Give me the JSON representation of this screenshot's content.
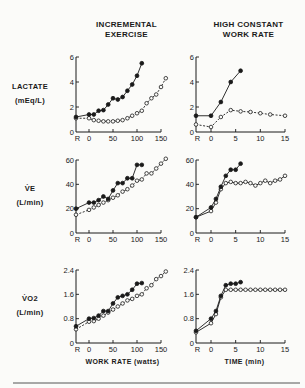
{
  "chart_data": [
    {
      "type": "line",
      "id": "lactate-incremental",
      "column_title": [
        "INCREMENTAL",
        "EXERCISE"
      ],
      "ylabel": [
        "LACTATE",
        "(mEq/L)"
      ],
      "xlabel": "",
      "xlim": [
        "R",
        150
      ],
      "ylim": [
        0,
        6
      ],
      "yticks": [
        0,
        2,
        4,
        6
      ],
      "ytick_labels": [
        "0",
        "2",
        "4",
        "6"
      ],
      "xticks": [
        "R",
        0,
        50,
        100,
        150
      ],
      "xtick_labels": [
        "R",
        "0",
        "50",
        "100",
        "150"
      ],
      "series": [
        {
          "name": "filled",
          "marker": "filled",
          "style": "solid",
          "x": [
            "R",
            0,
            10,
            20,
            30,
            40,
            50,
            60,
            70,
            80,
            90,
            100,
            110
          ],
          "y": [
            1.2,
            1.4,
            1.4,
            1.7,
            1.75,
            2.2,
            2.7,
            2.6,
            2.8,
            3.3,
            3.8,
            4.5,
            5.5
          ]
        },
        {
          "name": "open",
          "marker": "open",
          "style": "dashed",
          "x": [
            "R",
            0,
            10,
            20,
            30,
            40,
            50,
            60,
            70,
            80,
            90,
            100,
            110,
            120,
            130,
            140,
            150,
            160
          ],
          "y": [
            1.1,
            1.1,
            0.95,
            0.9,
            0.85,
            0.85,
            0.85,
            0.9,
            0.95,
            1.1,
            1.3,
            1.5,
            1.7,
            2.3,
            2.7,
            3.0,
            3.6,
            4.3
          ]
        }
      ]
    },
    {
      "type": "line",
      "id": "lactate-constant",
      "column_title": [
        "HIGH CONSTANT",
        "WORK RATE"
      ],
      "ylabel": [],
      "xlabel": "",
      "xlim": [
        "R",
        15
      ],
      "ylim": [
        0,
        6
      ],
      "yticks": [
        0,
        2,
        4,
        6
      ],
      "ytick_labels": [
        "0",
        "2",
        "4",
        "6"
      ],
      "xticks": [
        "R",
        0,
        5,
        10,
        15
      ],
      "xtick_labels": [
        "R",
        "0",
        "5",
        "10",
        "15"
      ],
      "series": [
        {
          "name": "filled",
          "marker": "filled",
          "style": "solid",
          "x": [
            "R",
            0,
            2,
            4,
            6
          ],
          "y": [
            1.3,
            1.3,
            2.4,
            4.0,
            4.9
          ]
        },
        {
          "name": "open",
          "marker": "open",
          "style": "dashed",
          "x": [
            "R",
            0,
            2,
            4,
            6,
            8,
            10,
            12,
            15
          ],
          "y": [
            0.6,
            0.4,
            1.2,
            1.75,
            1.65,
            1.6,
            1.5,
            1.4,
            1.3
          ]
        }
      ]
    },
    {
      "type": "line",
      "id": "ve-incremental",
      "column_title": [],
      "ylabel": [
        "V̇E",
        "(L/min)"
      ],
      "xlabel": "",
      "xlim": [
        "R",
        150
      ],
      "ylim": [
        0,
        60
      ],
      "yticks": [
        0,
        20,
        40,
        60
      ],
      "ytick_labels": [
        "0",
        "20",
        "40",
        "60"
      ],
      "xticks": [
        "R",
        0,
        50,
        100,
        150
      ],
      "xtick_labels": [
        "R",
        "0",
        "50",
        "100",
        "150"
      ],
      "series": [
        {
          "name": "filled",
          "marker": "filled",
          "style": "solid",
          "x": [
            "R",
            0,
            10,
            20,
            30,
            40,
            50,
            60,
            70,
            80,
            90,
            100,
            110
          ],
          "y": [
            20,
            25,
            25,
            27,
            30,
            28,
            35,
            41,
            41,
            45,
            45,
            56,
            56
          ]
        },
        {
          "name": "open",
          "marker": "open",
          "style": "dashed",
          "x": [
            "R",
            0,
            10,
            20,
            30,
            40,
            50,
            60,
            70,
            80,
            90,
            100,
            110,
            120,
            130,
            140,
            150,
            160
          ],
          "y": [
            15,
            19,
            21,
            23,
            25,
            27,
            29,
            31,
            34,
            36,
            39,
            43,
            44,
            49,
            49,
            53,
            57,
            61
          ]
        }
      ]
    },
    {
      "type": "line",
      "id": "ve-constant",
      "column_title": [],
      "ylabel": [],
      "xlabel": "",
      "xlim": [
        "R",
        15
      ],
      "ylim": [
        0,
        60
      ],
      "yticks": [
        0,
        20,
        40,
        60
      ],
      "ytick_labels": [
        "0",
        "20",
        "40",
        "60"
      ],
      "xticks": [
        "R",
        0,
        5,
        10,
        15
      ],
      "xtick_labels": [
        "R",
        "0",
        "5",
        "10",
        "15"
      ],
      "series": [
        {
          "name": "filled",
          "marker": "filled",
          "style": "solid",
          "x": [
            "R",
            0,
            1,
            2,
            3,
            4,
            5,
            6
          ],
          "y": [
            13,
            21,
            28,
            38,
            47,
            52,
            52,
            57
          ]
        },
        {
          "name": "open",
          "marker": "open",
          "style": "solid",
          "x": [
            "R",
            0,
            1,
            2,
            3,
            4,
            5,
            6,
            7,
            8,
            9,
            10,
            11,
            12,
            13,
            14,
            15
          ],
          "y": [
            13,
            18,
            25,
            36,
            41,
            42,
            41,
            41,
            42,
            41,
            39,
            41,
            43,
            41,
            43,
            44,
            47
          ]
        }
      ]
    },
    {
      "type": "line",
      "id": "vo2-incremental",
      "column_title": [],
      "ylabel": [
        "V̇O2",
        "(L/min)"
      ],
      "xlabel": "WORK RATE (watts)",
      "xlim": [
        "R",
        150
      ],
      "ylim": [
        0,
        2.4
      ],
      "yticks": [
        0,
        0.8,
        1.6,
        2.4
      ],
      "ytick_labels": [
        "0",
        "0.8",
        "1.6",
        "2.4"
      ],
      "xticks": [
        "R",
        0,
        50,
        100,
        150
      ],
      "xtick_labels": [
        "R",
        "0",
        "50",
        "100",
        "150"
      ],
      "series": [
        {
          "name": "filled",
          "marker": "filled",
          "style": "solid",
          "x": [
            "R",
            0,
            10,
            20,
            30,
            40,
            50,
            60,
            70,
            80,
            90,
            100,
            110
          ],
          "y": [
            0.55,
            0.8,
            0.82,
            0.9,
            1.05,
            1.05,
            1.3,
            1.5,
            1.55,
            1.6,
            1.75,
            1.95,
            1.97
          ]
        },
        {
          "name": "open",
          "marker": "open",
          "style": "dashed",
          "x": [
            "R",
            0,
            10,
            20,
            30,
            40,
            50,
            60,
            70,
            80,
            90,
            100,
            110,
            120,
            130,
            140,
            150,
            160
          ],
          "y": [
            0.45,
            0.7,
            0.72,
            0.8,
            0.9,
            1.0,
            1.1,
            1.2,
            1.3,
            1.4,
            1.45,
            1.55,
            1.6,
            1.8,
            1.9,
            2.1,
            2.2,
            2.35
          ]
        }
      ]
    },
    {
      "type": "line",
      "id": "vo2-constant",
      "column_title": [],
      "ylabel": [],
      "xlabel": "TIME (min)",
      "xlim": [
        "R",
        15
      ],
      "ylim": [
        0,
        2.4
      ],
      "yticks": [
        0,
        0.8,
        1.6,
        2.4
      ],
      "ytick_labels": [
        "0",
        "0.8",
        "1.6",
        "2.4"
      ],
      "xticks": [
        "R",
        0,
        5,
        10,
        15
      ],
      "xtick_labels": [
        "R",
        "0",
        "5",
        "10",
        "15"
      ],
      "series": [
        {
          "name": "filled",
          "marker": "filled",
          "style": "solid",
          "x": [
            "R",
            0,
            1,
            2,
            3,
            4,
            5,
            6
          ],
          "y": [
            0.4,
            0.8,
            1.05,
            1.55,
            1.9,
            1.95,
            1.95,
            2.0
          ]
        },
        {
          "name": "open",
          "marker": "open",
          "style": "solid",
          "x": [
            "R",
            0,
            1,
            2,
            3,
            4,
            5,
            6,
            7,
            8,
            9,
            10,
            11,
            12,
            13,
            14,
            15
          ],
          "y": [
            0.35,
            0.65,
            0.95,
            1.5,
            1.75,
            1.75,
            1.75,
            1.75,
            1.75,
            1.75,
            1.75,
            1.75,
            1.75,
            1.75,
            1.75,
            1.75,
            1.75
          ]
        }
      ]
    }
  ]
}
